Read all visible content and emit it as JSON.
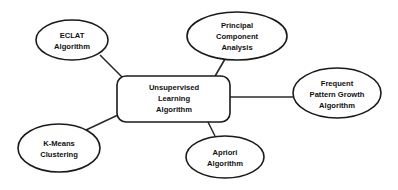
{
  "diagram": {
    "type": "mind-map",
    "center": {
      "label_lines": [
        "Unsupervised",
        "Learning",
        "Algorithm"
      ]
    },
    "nodes": [
      {
        "id": "eclat",
        "label_lines": [
          "ECLAT",
          "Algorithm"
        ]
      },
      {
        "id": "pca",
        "label_lines": [
          "Principal",
          "Component",
          "Analysis"
        ]
      },
      {
        "id": "fp-growth",
        "label_lines": [
          "Frequent",
          "Pattern Growth",
          "Algorithm"
        ]
      },
      {
        "id": "apriori",
        "label_lines": [
          "Apriori",
          "Algorithm"
        ]
      },
      {
        "id": "kmeans",
        "label_lines": [
          "K-Means",
          "Clustering"
        ]
      }
    ],
    "edges": [
      [
        "center",
        "eclat"
      ],
      [
        "center",
        "pca"
      ],
      [
        "center",
        "fp-growth"
      ],
      [
        "center",
        "apriori"
      ],
      [
        "center",
        "kmeans"
      ]
    ],
    "colors": {
      "stroke": "#1a1a1a",
      "fill": "#ffffff",
      "text": "#111111"
    }
  }
}
